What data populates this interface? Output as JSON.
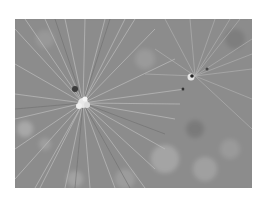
{
  "image": {
    "description": "Grayscale close-up photograph of pine needle clusters radiating outward",
    "background_color": "#ffffff",
    "tone": "#8a8a8a",
    "subjects": [
      {
        "name": "main-pine-cluster",
        "center": [
          83,
          103
        ]
      },
      {
        "name": "secondary-pine-cluster",
        "center": [
          195,
          76
        ]
      }
    ]
  }
}
